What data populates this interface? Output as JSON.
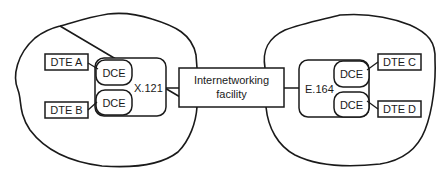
{
  "diagram": {
    "left_network": {
      "address_scheme": "X.121",
      "dce_top": "DCE",
      "dce_bottom": "DCE",
      "dte_top": "DTE A",
      "dte_bottom": "DTE B"
    },
    "interworking": {
      "line1": "Internetworking",
      "line2": "facility"
    },
    "right_network": {
      "address_scheme": "E.164",
      "dce_top": "DCE",
      "dce_bottom": "DCE",
      "dte_top": "DTE C",
      "dte_bottom": "DTE D"
    },
    "colors": {
      "stroke": "#1a1a1a",
      "background": "#ffffff"
    }
  }
}
